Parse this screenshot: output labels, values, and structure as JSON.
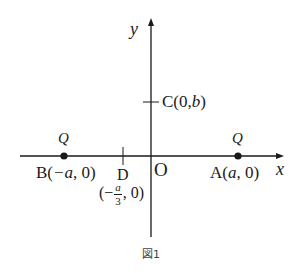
{
  "figure": {
    "caption": "図1",
    "axes": {
      "x_label": "x",
      "y_label": "y",
      "origin_label": "O"
    },
    "points": {
      "A": {
        "name": "A",
        "coords_prefix": "A(",
        "var": "a",
        "coords_suffix": ", 0)",
        "charge": "Q"
      },
      "B": {
        "name": "B",
        "coords_prefix": "B(",
        "var": "−a",
        "coords_suffix": ", 0)",
        "charge": "Q"
      },
      "C": {
        "name": "C",
        "label": "C(0,",
        "var": "b",
        "suffix": ")"
      },
      "D": {
        "name": "D",
        "label": "D",
        "open": "(−",
        "frac_num": "a",
        "frac_den": "3",
        "close": ", 0)"
      }
    },
    "colors": {
      "ink": "#1a1a1a",
      "background": "#ffffff"
    }
  }
}
